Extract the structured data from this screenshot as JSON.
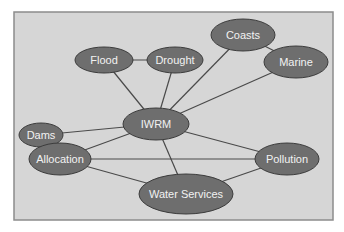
{
  "diagram": {
    "frame": {
      "x": 14,
      "y": 12,
      "width": 319,
      "height": 208,
      "fill": "#d6d6d6",
      "stroke": "#8c8c8c"
    },
    "node_style": {
      "fill": "#6e6e6e",
      "stroke": "#3c3c3c",
      "text_color": "#f2f2f2"
    },
    "edge_color": "#4a4a4a",
    "nodes": [
      {
        "id": "flood",
        "label": "Flood",
        "cx": 104,
        "cy": 60,
        "rx": 29,
        "ry": 13
      },
      {
        "id": "drought",
        "label": "Drought",
        "cx": 175,
        "cy": 60,
        "rx": 28,
        "ry": 13
      },
      {
        "id": "coasts",
        "label": "Coasts",
        "cx": 243,
        "cy": 35,
        "rx": 32,
        "ry": 16
      },
      {
        "id": "marine",
        "label": "Marine",
        "cx": 296,
        "cy": 62,
        "rx": 32,
        "ry": 16
      },
      {
        "id": "iwrm",
        "label": "IWRM",
        "cx": 156,
        "cy": 124,
        "rx": 33,
        "ry": 16
      },
      {
        "id": "dams",
        "label": "Dams",
        "cx": 41,
        "cy": 135,
        "rx": 22,
        "ry": 12
      },
      {
        "id": "allocation",
        "label": "Allocation",
        "cx": 60,
        "cy": 159,
        "rx": 31,
        "ry": 16
      },
      {
        "id": "pollution",
        "label": "Pollution",
        "cx": 287,
        "cy": 159,
        "rx": 32,
        "ry": 16
      },
      {
        "id": "water-services",
        "label": "Water Services",
        "cx": 186,
        "cy": 194,
        "rx": 47,
        "ry": 20
      }
    ],
    "edges": [
      [
        "flood",
        "drought"
      ],
      [
        "flood",
        "iwrm"
      ],
      [
        "drought",
        "iwrm"
      ],
      [
        "coasts",
        "iwrm"
      ],
      [
        "coasts",
        "marine"
      ],
      [
        "marine",
        "iwrm"
      ],
      [
        "iwrm",
        "dams"
      ],
      [
        "iwrm",
        "allocation"
      ],
      [
        "iwrm",
        "pollution"
      ],
      [
        "iwrm",
        "water-services"
      ],
      [
        "allocation",
        "pollution"
      ],
      [
        "allocation",
        "water-services"
      ],
      [
        "pollution",
        "water-services"
      ]
    ]
  }
}
